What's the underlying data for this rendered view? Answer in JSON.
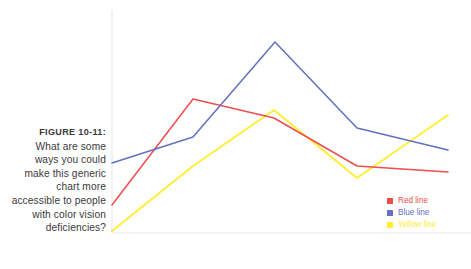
{
  "figure": {
    "label": "FIGURE 10-11:",
    "caption": "What are some ways you could make this generic chart more accessible to people with color vision deficiencies?"
  },
  "colors": {
    "red": "#ee4d4d",
    "blue": "#6370bf",
    "yellow": "#ffee2e",
    "axis": "#e9e9e9",
    "caption_text": "#3a3a3a",
    "background": "#ffffff"
  },
  "legend": {
    "position": "bottom-right",
    "items": [
      {
        "label": "Red line",
        "color": "#ee4d4d"
      },
      {
        "label": "Blue line",
        "color": "#6370bf"
      },
      {
        "label": "Yellow line",
        "color": "#ffee2e"
      }
    ]
  },
  "chart_data": {
    "type": "line",
    "title": "",
    "subtitle": "",
    "xlabel": "",
    "ylabel": "",
    "grid": false,
    "legend_position": "bottom-right",
    "axes": {
      "left_axis_visible": true,
      "bottom_axis_visible": true,
      "tick_labels_x": [],
      "tick_labels_y": [],
      "xlim": [
        0,
        4
      ],
      "ylim": [
        0,
        10
      ]
    },
    "x": [
      0,
      1,
      2,
      3,
      4
    ],
    "series": [
      {
        "name": "Red line",
        "color": "#ee4d4d",
        "values": [
          1.3,
          6.0,
          5.2,
          3.0,
          2.7
        ]
      },
      {
        "name": "Blue line",
        "color": "#6370bf",
        "values": [
          3.1,
          4.3,
          8.6,
          4.7,
          3.7
        ]
      },
      {
        "name": "Yellow line",
        "color": "#ffee2e",
        "values": [
          0.1,
          3.0,
          5.5,
          2.5,
          5.3
        ]
      }
    ],
    "plot_pixel_box": {
      "x0": 112,
      "y0": 10,
      "x1": 448,
      "y1": 233
    },
    "series_pixel_points": {
      "Red line": [
        [
          112,
          205
        ],
        [
          193,
          99
        ],
        [
          274,
          118
        ],
        [
          357,
          166
        ],
        [
          448,
          172
        ]
      ],
      "Blue line": [
        [
          112,
          163
        ],
        [
          193,
          137
        ],
        [
          275,
          42
        ],
        [
          357,
          128
        ],
        [
          448,
          150
        ]
      ],
      "Yellow line": [
        [
          112,
          231
        ],
        [
          193,
          166
        ],
        [
          274,
          110
        ],
        [
          357,
          178
        ],
        [
          448,
          115
        ]
      ]
    }
  }
}
